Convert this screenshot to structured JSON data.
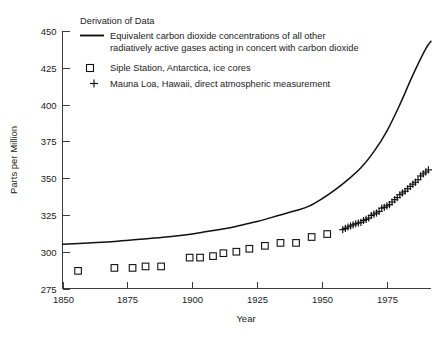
{
  "chart_data": {
    "type": "scatter",
    "title": "",
    "xlabel": "Year",
    "ylabel": "Parts per Million",
    "xlim": [
      1850,
      1992
    ],
    "ylim": [
      275,
      450
    ],
    "xticks": [
      1850,
      1875,
      1900,
      1925,
      1950,
      1975
    ],
    "yticks": [
      275,
      300,
      325,
      350,
      375,
      400,
      425,
      450
    ],
    "xtick_labels": [
      "1850",
      "1875",
      "1900",
      "1925",
      "1950",
      "1975"
    ],
    "ytick_labels": [
      "275",
      "300",
      "325",
      "350",
      "375",
      "400",
      "425",
      "450"
    ],
    "grid": false,
    "legend_position": "top-left",
    "series": [
      {
        "name": "Equivalent carbon dioxide concentrations of all other radiatively active gases acting in concert with carbon dioxide",
        "marker": "line",
        "x": [
          1850,
          1860,
          1870,
          1880,
          1890,
          1900,
          1905,
          1910,
          1915,
          1920,
          1925,
          1930,
          1935,
          1940,
          1945,
          1950,
          1955,
          1960,
          1965,
          1970,
          1975,
          1980,
          1985,
          1990,
          1992
        ],
        "values": [
          305,
          306,
          307,
          308.5,
          310,
          312,
          313.5,
          315,
          316.5,
          318.5,
          320.5,
          323,
          325.5,
          328,
          331,
          336,
          342,
          349,
          357,
          368,
          382,
          400,
          420,
          438,
          443
        ]
      },
      {
        "name": "Siple Station, Antarctica, ice cores",
        "marker": "square",
        "x": [
          1856,
          1870,
          1877,
          1882,
          1888,
          1899,
          1903,
          1908,
          1912,
          1917,
          1922,
          1928,
          1934,
          1940,
          1946,
          1952
        ],
        "values": [
          287,
          289,
          289,
          290,
          290,
          296,
          296,
          297,
          299,
          300,
          302,
          304,
          306,
          306,
          310,
          312
        ]
      },
      {
        "name": "Mauna Loa, Hawaii, direct atmospheric measurement",
        "marker": "plus",
        "x": [
          1958,
          1959,
          1960,
          1961,
          1962,
          1963,
          1964,
          1965,
          1966,
          1967,
          1968,
          1969,
          1970,
          1971,
          1972,
          1973,
          1974,
          1975,
          1976,
          1977,
          1978,
          1979,
          1980,
          1981,
          1982,
          1983,
          1984,
          1985,
          1986,
          1987,
          1988,
          1989,
          1990,
          1991
        ],
        "values": [
          315,
          315.8,
          316.8,
          317.5,
          318.3,
          319,
          319.5,
          320,
          321.2,
          322,
          322.9,
          324.6,
          325.6,
          326.3,
          327.4,
          329.6,
          330.2,
          331.1,
          332,
          333.8,
          335.4,
          336.8,
          338.7,
          339.9,
          341.1,
          342.8,
          344.4,
          345.9,
          347.2,
          348.9,
          351.5,
          352.9,
          354.2,
          355.6
        ]
      }
    ]
  },
  "legend": {
    "heading": "Derivation of Data",
    "entries": [
      {
        "marker": "line",
        "label_line1": "Equivalent carbon dioxide concentrations of all other",
        "label_line2": "radiatively active gases acting in concert with carbon dioxide"
      },
      {
        "marker": "square",
        "label_line1": "Siple Station, Antarctica, ice cores",
        "label_line2": ""
      },
      {
        "marker": "plus",
        "label_line1": "Mauna Loa, Hawaii, direct atmospheric measurement",
        "label_line2": ""
      }
    ]
  },
  "colors": {
    "ink": "#111111",
    "axis": "#3c3c3c",
    "background": "#ffffff"
  }
}
